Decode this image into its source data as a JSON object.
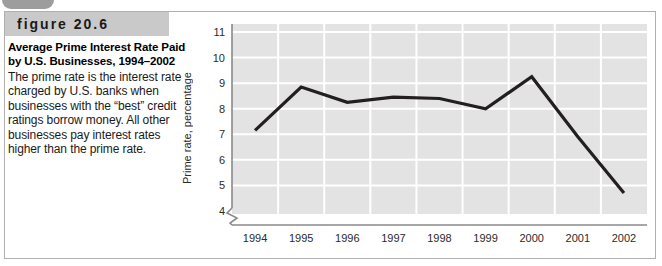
{
  "figure": {
    "tab_icon": "corner-tab-icon",
    "header_label": "figure 20.6",
    "caption_title": "Average Prime Interest Rate Paid by U.S. Businesses, 1994–2002",
    "caption_body": "The prime rate is the interest rate charged by U.S. banks when businesses with the “best” credit ratings borrow money. All other businesses pay interest rates higher than the prime rate."
  },
  "colors": {
    "header_band": "#c9c9c9",
    "tab": "#9d9d9d",
    "plot_background": "#e3e3e3",
    "gridline": "#ffffff",
    "series_line": "#231f20",
    "frame_border": "#b0b0b0",
    "axis": "#8a8a8a"
  },
  "chart_data": {
    "type": "line",
    "title": "",
    "xlabel": "",
    "ylabel": "Prime rate, percentage",
    "categories": [
      "1994",
      "1995",
      "1996",
      "1997",
      "1998",
      "1999",
      "2000",
      "2001",
      "2002"
    ],
    "values": [
      7.15,
      8.85,
      8.25,
      8.45,
      8.4,
      8.0,
      9.25,
      6.9,
      4.7
    ],
    "series": [
      {
        "name": "Prime rate",
        "values": [
          7.15,
          8.85,
          8.25,
          8.45,
          8.4,
          8.0,
          9.25,
          6.9,
          4.7
        ]
      }
    ],
    "ylim": [
      4,
      11
    ],
    "yticks": [
      4,
      5,
      6,
      7,
      8,
      9,
      10,
      11
    ],
    "ytick_labels": [
      "4",
      "5",
      "6",
      "7",
      "8",
      "9",
      "10",
      "11"
    ],
    "xtick_labels": [
      "1994",
      "1995",
      "1996",
      "1997",
      "1998",
      "1999",
      "2000",
      "2001",
      "2002"
    ],
    "grid": true,
    "legend": "none",
    "axis_break": true,
    "annotations": []
  }
}
